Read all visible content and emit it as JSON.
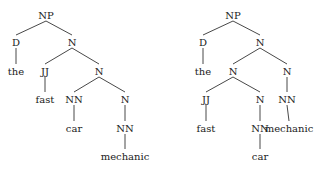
{
  "trees": [
    {
      "id": "left",
      "nodes": [
        {
          "id": "np",
          "label": "NP",
          "x": 46,
          "y": 16
        },
        {
          "id": "d",
          "label": "D",
          "x": 16,
          "y": 43
        },
        {
          "id": "n1",
          "label": "N",
          "x": 72,
          "y": 43
        },
        {
          "id": "the",
          "label": "the",
          "x": 16,
          "y": 72
        },
        {
          "id": "jj",
          "label": "JJ",
          "x": 45,
          "y": 72
        },
        {
          "id": "n2",
          "label": "N",
          "x": 99,
          "y": 72
        },
        {
          "id": "fast",
          "label": "fast",
          "x": 45,
          "y": 100
        },
        {
          "id": "nn1",
          "label": "NN",
          "x": 74,
          "y": 100
        },
        {
          "id": "n3",
          "label": "N",
          "x": 125,
          "y": 100
        },
        {
          "id": "car",
          "label": "car",
          "x": 74,
          "y": 129
        },
        {
          "id": "nn2",
          "label": "NN",
          "x": 125,
          "y": 129
        },
        {
          "id": "mechanic",
          "label": "mechanic",
          "x": 125,
          "y": 157
        }
      ],
      "edges": [
        [
          "np",
          "d"
        ],
        [
          "np",
          "n1"
        ],
        [
          "d",
          "the"
        ],
        [
          "n1",
          "jj"
        ],
        [
          "n1",
          "n2"
        ],
        [
          "jj",
          "fast"
        ],
        [
          "n2",
          "nn1"
        ],
        [
          "n2",
          "n3"
        ],
        [
          "nn1",
          "car"
        ],
        [
          "n3",
          "nn2"
        ],
        [
          "nn2",
          "mechanic"
        ]
      ]
    },
    {
      "id": "right",
      "nodes": [
        {
          "id": "np",
          "label": "NP",
          "x": 233,
          "y": 16
        },
        {
          "id": "d",
          "label": "D",
          "x": 203,
          "y": 43
        },
        {
          "id": "n1",
          "label": "N",
          "x": 260,
          "y": 43
        },
        {
          "id": "the",
          "label": "the",
          "x": 203,
          "y": 72
        },
        {
          "id": "n2",
          "label": "N",
          "x": 233,
          "y": 72
        },
        {
          "id": "n3",
          "label": "N",
          "x": 287,
          "y": 72
        },
        {
          "id": "jj",
          "label": "JJ",
          "x": 206,
          "y": 100
        },
        {
          "id": "n4",
          "label": "N",
          "x": 260,
          "y": 100
        },
        {
          "id": "nn1",
          "label": "NN",
          "x": 287,
          "y": 100
        },
        {
          "id": "fast",
          "label": "fast",
          "x": 206,
          "y": 129
        },
        {
          "id": "nn2",
          "label": "NN",
          "x": 260,
          "y": 129
        },
        {
          "id": "mechanic",
          "label": "mechanic",
          "x": 289,
          "y": 129
        },
        {
          "id": "car",
          "label": "car",
          "x": 260,
          "y": 157
        }
      ],
      "edges": [
        [
          "np",
          "d"
        ],
        [
          "np",
          "n1"
        ],
        [
          "d",
          "the"
        ],
        [
          "n1",
          "n2"
        ],
        [
          "n1",
          "n3"
        ],
        [
          "n2",
          "jj"
        ],
        [
          "n2",
          "n4"
        ],
        [
          "n3",
          "nn1"
        ],
        [
          "jj",
          "fast"
        ],
        [
          "n4",
          "nn2"
        ],
        [
          "nn1",
          "mechanic"
        ],
        [
          "nn2",
          "car"
        ]
      ]
    }
  ]
}
